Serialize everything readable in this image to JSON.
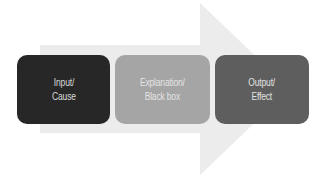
{
  "diagram": {
    "type": "process-arrow",
    "arrow": {
      "color": "#ececec",
      "direction": "right"
    },
    "steps": [
      {
        "label": "Input/\nCause",
        "color": "#272727",
        "text_color": "#d9d9d9"
      },
      {
        "label": "Explanation/\nBlack box",
        "color": "#a5a5a5",
        "text_color": "#e4e4e4"
      },
      {
        "label": "Output/\nEffect",
        "color": "#5e5e5e",
        "text_color": "#e2e2e2"
      }
    ]
  }
}
